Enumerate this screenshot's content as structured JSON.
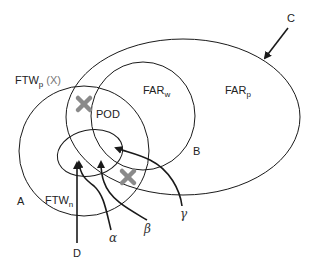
{
  "diagram": {
    "regions": [
      {
        "id": "C",
        "label_main": "FAR",
        "label_sub": "p",
        "marker": "C"
      },
      {
        "id": "B",
        "label_main": "FAR",
        "label_sub": "w",
        "marker": "B"
      },
      {
        "id": "A",
        "label_main": "FTW",
        "label_sub": "p",
        "label_suffix": "(X)",
        "marker": "A"
      },
      {
        "id": "D",
        "label_main": "FTW",
        "label_sub": "n",
        "marker": "D"
      }
    ],
    "labels": {
      "ftwp_main": "FTW",
      "ftwp_sub": "p",
      "ftwp_suffix": "(X)",
      "farw_main": "FAR",
      "farw_sub": "w",
      "farp_main": "FAR",
      "farp_sub": "p",
      "ftwn_main": "FTW",
      "ftwn_sub": "n",
      "pod": "POD",
      "A": "A",
      "B": "B",
      "C": "C",
      "D": "D",
      "alpha": "α",
      "beta": "β",
      "gamma": "γ"
    },
    "colors": {
      "stroke": "#1a1a1a",
      "cross": "#8a8a8a",
      "background": "#ffffff"
    },
    "markers": [
      {
        "name": "cross-upper",
        "x": 84,
        "y": 104
      },
      {
        "name": "cross-lower",
        "x": 128,
        "y": 177
      }
    ]
  }
}
